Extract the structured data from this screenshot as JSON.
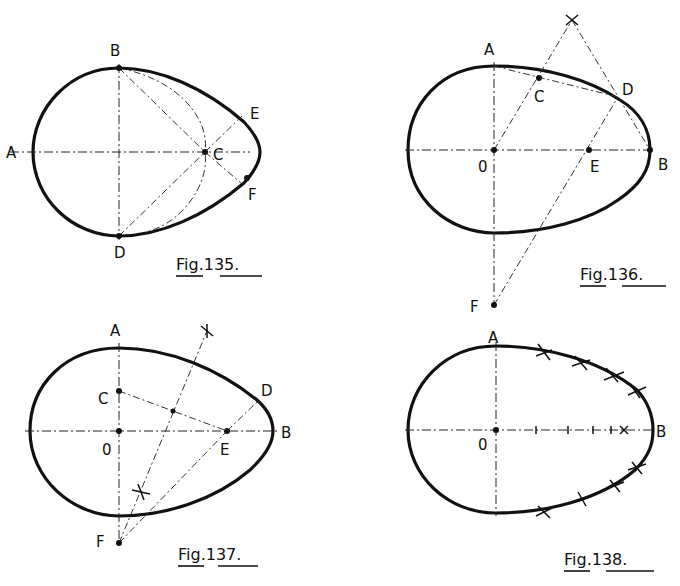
{
  "figures": [
    {
      "id": "fig135",
      "caption": "Fig.135.",
      "labels": {
        "A": "A",
        "B": "B",
        "C": "C",
        "D": "D",
        "E": "E",
        "F": "F"
      }
    },
    {
      "id": "fig136",
      "caption": "Fig.136.",
      "labels": {
        "A": "A",
        "B": "B",
        "C": "C",
        "D": "D",
        "E": "E",
        "F": "F",
        "O": "0"
      }
    },
    {
      "id": "fig137",
      "caption": "Fig.137.",
      "labels": {
        "A": "A",
        "B": "B",
        "C": "C",
        "D": "D",
        "E": "E",
        "F": "F",
        "O": "0"
      }
    },
    {
      "id": "fig138",
      "caption": "Fig.138.",
      "labels": {
        "A": "A",
        "B": "B",
        "O": "0"
      }
    }
  ],
  "colors": {
    "ink": "#111111",
    "paper": "#ffffff"
  }
}
